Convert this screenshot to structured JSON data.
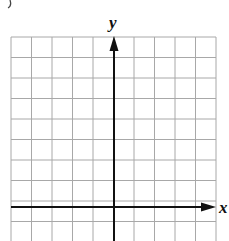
{
  "diagram": {
    "type": "coordinate-grid",
    "x_axis_label": "x",
    "y_axis_label": "y",
    "grid": {
      "columns": 10,
      "rows_visible": 10,
      "cell_px": 20.5
    },
    "colors": {
      "grid": "#a8a8a8",
      "axis": "#111111",
      "background": "#ffffff"
    }
  }
}
